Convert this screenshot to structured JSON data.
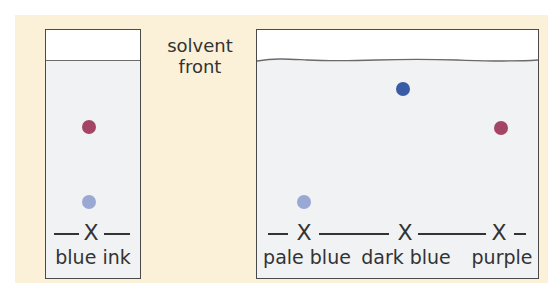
{
  "caption": {
    "line1": "solvent",
    "line2": "front"
  },
  "colors": {
    "background": "#fbf1d8",
    "paper": "#f1f2f3",
    "red_purple": "#a54566",
    "pale_blue": "#9aa9d3",
    "dark_blue": "#3a5ba6"
  },
  "left_chromatogram": {
    "sample_label": "blue ink",
    "origin_mark": "X",
    "spots": [
      {
        "name": "red-purple-spot",
        "color": "#a54566"
      },
      {
        "name": "pale-blue-spot",
        "color": "#9aa9d3"
      }
    ]
  },
  "right_chromatogram": {
    "origin_mark": "X",
    "samples": [
      {
        "label": "pale blue",
        "spot_color": "#9aa9d3"
      },
      {
        "label": "dark blue",
        "spot_color": "#3a5ba6"
      },
      {
        "label": "purple",
        "spot_color": "#a54566"
      }
    ]
  }
}
